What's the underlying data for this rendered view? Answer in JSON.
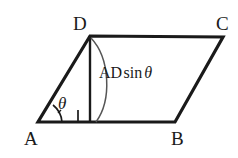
{
  "figure": {
    "type": "geometry-diagram",
    "background_color": "#ffffff",
    "stroke_color": "#1a1a1a",
    "vertices": [
      {
        "name": "A",
        "label": "A",
        "x": 38,
        "y": 122,
        "label_x": 24,
        "label_y": 129
      },
      {
        "name": "B",
        "label": "B",
        "x": 175,
        "y": 122,
        "label_x": 171,
        "label_y": 129
      },
      {
        "name": "C",
        "label": "C",
        "x": 223,
        "y": 37,
        "label_x": 216,
        "label_y": 14
      },
      {
        "name": "D",
        "label": "D",
        "x": 90,
        "y": 36,
        "label_x": 73,
        "label_y": 14
      }
    ],
    "edges": [
      {
        "name": "side-AB",
        "from": "A",
        "to": "B"
      },
      {
        "name": "side-BC",
        "from": "B",
        "to": "C"
      },
      {
        "name": "side-CD",
        "from": "C",
        "to": "D"
      },
      {
        "name": "side-DA",
        "from": "D",
        "to": "A"
      }
    ],
    "altitude": {
      "name": "altitude-from-D",
      "from_x": 90,
      "from_y": 36,
      "to_x": 90,
      "to_y": 122,
      "label_parts": {
        "segment": "AD",
        "function": "sin",
        "variable": "θ"
      },
      "label_text": "AD sin θ"
    },
    "angle": {
      "name": "angle-at-A",
      "label": "θ",
      "at_x": 38,
      "at_y": 122,
      "label_x": 58,
      "label_y": 95
    },
    "right_angle_marker": {
      "name": "right-angle-at-foot",
      "x": 78,
      "y": 110,
      "size": 12
    },
    "brace_arc": {
      "name": "height-brace-arc",
      "from_x": 92,
      "from_y": 38,
      "to_x": 96,
      "to_y": 122
    }
  }
}
